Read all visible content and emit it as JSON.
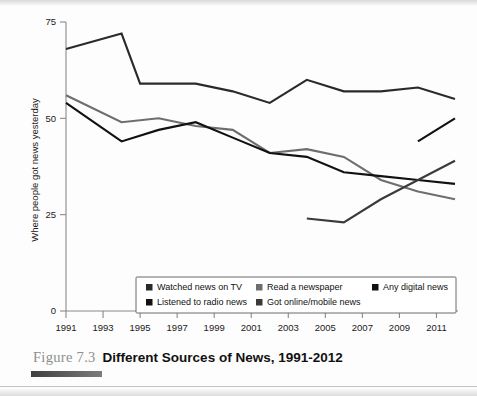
{
  "figure": {
    "number_label": "Figure 7.3",
    "title": "Different Sources of News, 1991-2012"
  },
  "chart_data": {
    "type": "line",
    "title": "Different Sources of News, 1991-2012",
    "xlabel": "",
    "ylabel": "Where people got news yesterday",
    "xlim": [
      1991,
      2012
    ],
    "ylim": [
      0,
      75
    ],
    "grid": false,
    "legend_position": "inside-bottom-center",
    "y_ticks": [
      "0",
      "25",
      "50",
      "75"
    ],
    "y_tick_values": [
      0,
      25,
      50,
      75
    ],
    "x_ticks": [
      "1991",
      "1993",
      "1995",
      "1997",
      "1999",
      "2001",
      "2003",
      "2005",
      "2007",
      "2009",
      "2011"
    ],
    "x_tick_values": [
      1991,
      1993,
      1995,
      1997,
      1999,
      2001,
      2003,
      2005,
      2007,
      2009,
      2011
    ],
    "series": [
      {
        "name": "Watched news on TV",
        "color": "#2a2a2a",
        "stroke_width": 2.1,
        "x": [
          1991,
          1994,
          1995,
          1996,
          1998,
          2000,
          2002,
          2004,
          2006,
          2008,
          2010,
          2012
        ],
        "values": [
          68,
          72,
          59,
          59,
          59,
          57,
          54,
          60,
          57,
          57,
          58,
          55
        ]
      },
      {
        "name": "Read a newspaper",
        "color": "#6e6e6e",
        "stroke_width": 2.1,
        "x": [
          1991,
          1994,
          1996,
          1998,
          2000,
          2002,
          2004,
          2006,
          2008,
          2010,
          2012
        ],
        "values": [
          56,
          49,
          50,
          48,
          47,
          41,
          42,
          40,
          34,
          31,
          29
        ]
      },
      {
        "name": "Listened to radio news",
        "color": "#111111",
        "stroke_width": 2.1,
        "x": [
          1991,
          1994,
          1996,
          1998,
          2000,
          2002,
          2004,
          2006,
          2008,
          2010,
          2012
        ],
        "values": [
          54,
          44,
          47,
          49,
          45,
          41,
          40,
          36,
          35,
          34,
          33
        ]
      },
      {
        "name": "Got online/mobile news",
        "color": "#3a3a3a",
        "stroke_width": 2.1,
        "x": [
          2004,
          2006,
          2008,
          2010,
          2012
        ],
        "values": [
          24,
          23,
          29,
          34,
          39
        ]
      },
      {
        "name": "Any digital news",
        "color": "#111111",
        "stroke_width": 2.1,
        "x": [
          2010,
          2012
        ],
        "values": [
          44,
          50
        ]
      }
    ],
    "legend": [
      {
        "label": "Watched news on TV",
        "color": "#2a2a2a"
      },
      {
        "label": "Read a newspaper",
        "color": "#6e6e6e"
      },
      {
        "label": "Any digital news",
        "color": "#111111"
      },
      {
        "label": "Listened to radio news",
        "color": "#111111"
      },
      {
        "label": "Got online/mobile news",
        "color": "#3a3a3a"
      }
    ]
  }
}
